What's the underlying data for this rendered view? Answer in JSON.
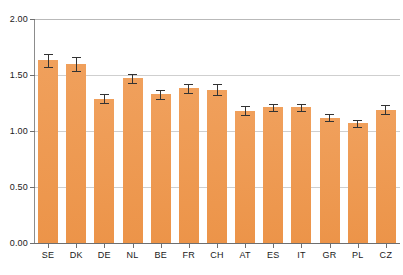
{
  "chart_data": {
    "type": "bar",
    "title": "",
    "subtitle": "",
    "xlabel": "",
    "ylabel": "",
    "categories": [
      "SE",
      "DK",
      "DE",
      "NL",
      "BE",
      "FR",
      "CH",
      "AT",
      "ES",
      "IT",
      "GR",
      "PL",
      "CZ"
    ],
    "values": [
      1.63,
      1.6,
      1.29,
      1.47,
      1.33,
      1.38,
      1.37,
      1.18,
      1.21,
      1.21,
      1.12,
      1.07,
      1.19
    ],
    "errors": [
      0.06,
      0.06,
      0.04,
      0.04,
      0.04,
      0.04,
      0.05,
      0.04,
      0.03,
      0.03,
      0.03,
      0.03,
      0.04
    ],
    "ylim": [
      0.0,
      2.0
    ],
    "yticks": [
      0.0,
      0.5,
      1.0,
      1.5,
      2.0
    ],
    "ytick_labels": [
      "0.00",
      "0.50",
      "1.00",
      "1.50",
      "2.00"
    ],
    "grid": true,
    "legend": null,
    "bar_color": "#ee9a52",
    "error_bar_color": "#333333",
    "axis_color": "#6e6e6e",
    "grid_color": "#bfbfbf"
  }
}
